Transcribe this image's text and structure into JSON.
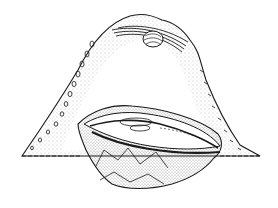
{
  "illustration": {
    "subject": "oyster",
    "style": "pen-and-ink stipple line drawing",
    "background_color": "#ffffff",
    "ink_color": "#1a1a1a",
    "elements": [
      "upper-shell",
      "pearl",
      "hinge-ligament",
      "lower-shell",
      "oyster-body",
      "mantle-edge"
    ]
  }
}
